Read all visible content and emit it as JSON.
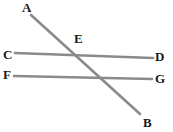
{
  "figure": {
    "width": 173,
    "height": 132,
    "background_color": "#ffffff",
    "line_color": "#8a8a8a",
    "label_color": "#1a1a1a",
    "line_width": 2.6
  },
  "labels": {
    "a": "A",
    "b": "B",
    "c": "C",
    "d": "D",
    "e": "E",
    "f": "F",
    "g": "G"
  },
  "chart_data": {
    "type": "scatter",
    "xlabel": "",
    "ylabel": "",
    "xlim": [
      0,
      173
    ],
    "ylim": [
      132,
      0
    ],
    "grid": false,
    "legend": "none",
    "segments": [
      {
        "name": "AB",
        "from_label": "A",
        "to_label": "B",
        "x1": 31,
        "y1": 15,
        "x2": 140,
        "y2": 114,
        "color": "#8a8a8a"
      },
      {
        "name": "CD",
        "from_label": "C",
        "to_label": "D",
        "x1": 15,
        "y1": 53,
        "x2": 153,
        "y2": 58,
        "color": "#8a8a8a"
      },
      {
        "name": "FG",
        "from_label": "F",
        "to_label": "G",
        "x1": 14,
        "y1": 76,
        "x2": 152,
        "y2": 79,
        "color": "#8a8a8a"
      }
    ],
    "points": [
      {
        "label": "A",
        "x": 27,
        "y": 8,
        "label_x": 22,
        "label_y": 1
      },
      {
        "label": "E",
        "x": 79,
        "y": 38,
        "label_x": 74,
        "label_y": 32
      },
      {
        "label": "C",
        "x": 8,
        "y": 54,
        "label_x": 3,
        "label_y": 48
      },
      {
        "label": "D",
        "x": 160,
        "y": 56,
        "label_x": 155,
        "label_y": 50
      },
      {
        "label": "F",
        "x": 8,
        "y": 74,
        "label_x": 3,
        "label_y": 68
      },
      {
        "label": "G",
        "x": 160,
        "y": 78,
        "label_x": 155,
        "label_y": 72
      },
      {
        "label": "B",
        "x": 148,
        "y": 122,
        "label_x": 143,
        "label_y": 116
      }
    ],
    "intersections": [
      {
        "name": "AB-CD",
        "x": 70,
        "y": 56
      },
      {
        "name": "AB-FG",
        "x": 96,
        "y": 75
      }
    ]
  }
}
